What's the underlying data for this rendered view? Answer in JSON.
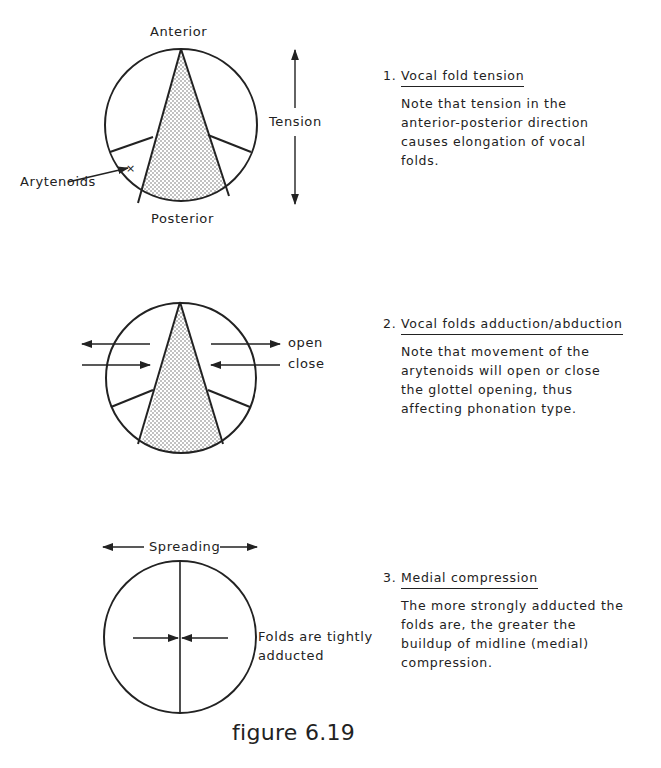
{
  "figure": {
    "caption": "figure 6.19",
    "colors": {
      "ink": "#222222",
      "background": "#ffffff",
      "stipple": "#555555"
    }
  },
  "panels": [
    {
      "diagram": {
        "labels": {
          "top": "Anterior",
          "bottom": "Posterior",
          "side": "Tension",
          "pointer": "Arytenoids"
        }
      },
      "item": {
        "number": "1.",
        "title": "Vocal fold tension",
        "body_lines": [
          "Note that tension in the",
          "anterior-posterior direction",
          "causes elongation of vocal",
          "folds."
        ]
      }
    },
    {
      "diagram": {
        "labels": {
          "arrow_upper": "open",
          "arrow_lower": "close"
        }
      },
      "item": {
        "number": "2.",
        "title": "Vocal folds adduction/abduction",
        "body_lines": [
          "Note that movement of the",
          "arytenoids will open or close",
          "the glottel opening, thus",
          "affecting phonation type."
        ]
      }
    },
    {
      "diagram": {
        "labels": {
          "top": "Spreading",
          "side_line1": "Folds are tightly",
          "side_line2": "adducted"
        }
      },
      "item": {
        "number": "3.",
        "title": "Medial compression",
        "body_lines": [
          "The more strongly adducted the",
          "folds are, the greater the",
          "buildup of midline (medial)",
          "compression."
        ]
      }
    }
  ]
}
